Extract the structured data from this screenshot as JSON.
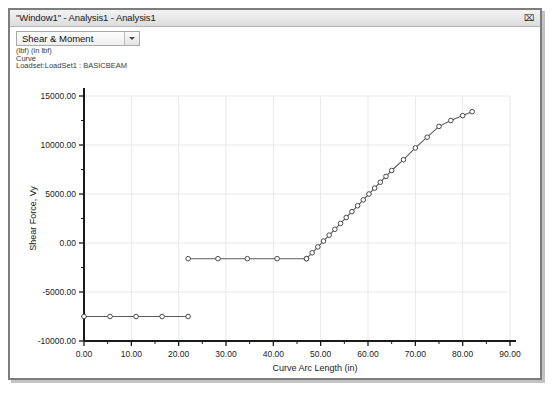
{
  "window": {
    "title": "\"Window1\" - Analysis1 - Analysis1",
    "close_icon": "close-icon",
    "close_glyph": "⌧"
  },
  "toolbar": {
    "view_select_value": "Shear & Moment",
    "view_select_arrow_icon": "chevron-down-icon"
  },
  "plot_header": {
    "units_line": "(lbf)  (in lbf)",
    "curve_line": "Curve",
    "loadset_line": "Loadset:LoadSet1 : BASICBEAM"
  },
  "legend": {
    "entries": [
      {
        "label": "Shear Force, Vy",
        "marker": "circle",
        "color": "#555555"
      }
    ]
  },
  "colors": {
    "axis": "#1a1a1a",
    "grid": "#e9e9e9",
    "curve": "#5a5a5a",
    "marker_stroke": "#4a4a4a",
    "marker_fill": "#ffffff",
    "window_border": "#7d7d7d",
    "titlebar": "#e6e6e6"
  },
  "chart_data": {
    "type": "line",
    "title": "",
    "xlabel": "Curve Arc Length (in)",
    "ylabel": "Shear Force, Vy",
    "xlim": [
      0,
      90
    ],
    "ylim": [
      -10000,
      15000
    ],
    "xticks": [
      0,
      10,
      20,
      30,
      40,
      50,
      60,
      70,
      80,
      90
    ],
    "xtick_labels": [
      "0.00",
      "10.00",
      "20.00",
      "30.00",
      "40.00",
      "50.00",
      "60.00",
      "70.00",
      "80.00",
      "90.00"
    ],
    "yticks": [
      -10000,
      -5000,
      0,
      5000,
      10000,
      15000
    ],
    "ytick_labels": [
      "-10000.00",
      "-5000.00",
      "0.00",
      "5000.00",
      "10000.00",
      "15000.00"
    ],
    "minor_tick_count_x": 1,
    "minor_tick_count_y": 1,
    "grid": true,
    "legend_position": "bottom-left",
    "series": [
      {
        "name": "Shear Force, Vy",
        "marker": "circle",
        "color": "#5a5a5a",
        "segments": [
          {
            "name": "lower-constant-segment",
            "x": [
              0.0,
              5.5,
              11.0,
              16.5,
              22.0
            ],
            "y": [
              -7500,
              -7500,
              -7500,
              -7500,
              -7500
            ]
          },
          {
            "name": "mid-constant-segment",
            "x": [
              22.0,
              28.3,
              34.5,
              40.8,
              47.0
            ],
            "y": [
              -1600,
              -1600,
              -1600,
              -1600,
              -1600
            ]
          },
          {
            "name": "rising-segment",
            "x": [
              47.0,
              48.2,
              49.4,
              50.6,
              51.8,
              53.0,
              54.2,
              55.4,
              56.6,
              57.8,
              59.0,
              60.2,
              61.4,
              62.6,
              63.8,
              65.0,
              67.5,
              70.0,
              72.5,
              75.0,
              77.5,
              80.0,
              82.0
            ],
            "y": [
              -1600,
              -1000,
              -400,
              200,
              800,
              1400,
              2000,
              2600,
              3200,
              3800,
              4400,
              5000,
              5600,
              6200,
              6800,
              7400,
              8500,
              9700,
              10800,
              11900,
              12500,
              13000,
              13400
            ]
          }
        ]
      }
    ]
  }
}
